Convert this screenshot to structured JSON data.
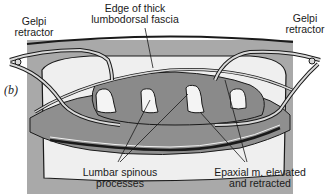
{
  "figure": {
    "panel_label": "(b)",
    "labels": {
      "gelpi_left_line1": "Gelpi",
      "gelpi_left_line2": "retractor",
      "gelpi_right_line1": "Gelpi",
      "gelpi_right_line2": "retractor",
      "fascia_line1": "Edge of thick",
      "fascia_line2": "lumbodorsal fascia",
      "spinous_line1": "Lumbar spinous",
      "spinous_line2": "processes",
      "epaxial_line1": "Epaxial m. elevated",
      "epaxial_line2": "and retracted"
    },
    "colors": {
      "background_gray": "#a9a9a9",
      "muscle_gray": "#8f8f8f",
      "light_area": "#efefef",
      "retractor": "#d9d9d9",
      "outline": "#1a1a1a"
    }
  }
}
